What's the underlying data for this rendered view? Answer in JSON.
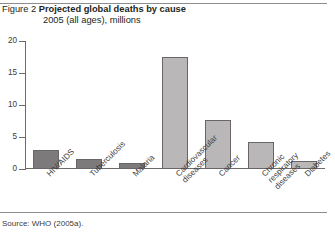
{
  "figure": {
    "label": "Figure 2",
    "title": "Projected global deaths by cause",
    "subtitle": "2005 (all ages), millions",
    "source": "Source: WHO (2005a)."
  },
  "colors": {
    "bar_infectious": "#7d7a7b",
    "bar_chronic": "#b9b7b7",
    "bar_border": "#6a6667",
    "axis": "#6e6a6b",
    "text": "#231f20",
    "rule": "#8d8d8d"
  },
  "chart_data": {
    "type": "bar",
    "title": "Projected global deaths by cause",
    "subtitle": "2005 (all ages), millions",
    "xlabel": "",
    "ylabel": "",
    "ylim": [
      0,
      20
    ],
    "yticks": [
      0,
      5,
      10,
      15,
      20
    ],
    "grid": false,
    "legend": false,
    "categories": [
      "HIV/AIDS",
      "Tuberculosis",
      "Malaria",
      "Cardiovascular diseases",
      "Cancer",
      "Chronic respiratory diseases",
      "Diabetes"
    ],
    "values": [
      2.9,
      1.6,
      0.9,
      17.5,
      7.6,
      4.2,
      1.2
    ],
    "bar_colors": [
      "#7d7a7b",
      "#7d7a7b",
      "#7d7a7b",
      "#b9b7b7",
      "#b9b7b7",
      "#b9b7b7",
      "#b9b7b7"
    ],
    "units": "millions of deaths"
  }
}
